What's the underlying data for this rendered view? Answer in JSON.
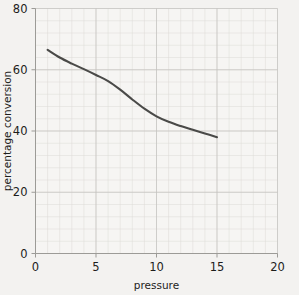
{
  "chart_data": {
    "type": "line",
    "title": "",
    "xlabel": "pressure",
    "ylabel": "percentage conversion",
    "xlim": [
      0,
      20
    ],
    "ylim": [
      0,
      80
    ],
    "xticks": [
      0,
      5,
      10,
      15,
      20
    ],
    "yticks": [
      0,
      20,
      40,
      60,
      80
    ],
    "xtick_labels": [
      "0",
      "5",
      "10",
      "15",
      "20"
    ],
    "ytick_labels": [
      "0",
      "20",
      "40",
      "60",
      "80"
    ],
    "grid": true,
    "grid_minor_step": 1,
    "grid_major_step": 5,
    "legend": null,
    "series": [
      {
        "name": "percentage conversion vs pressure",
        "color": "#4a4a48",
        "x": [
          1.0,
          2.0,
          3.0,
          4.0,
          5.0,
          6.0,
          7.0,
          8.0,
          9.0,
          10.0,
          11.0,
          12.0,
          13.0,
          14.0,
          15.0
        ],
        "values": [
          66.5,
          64.0,
          62.0,
          60.2,
          58.3,
          56.3,
          53.5,
          50.3,
          47.3,
          44.8,
          43.0,
          41.6,
          40.4,
          39.2,
          38.0
        ]
      }
    ]
  },
  "colors": {
    "background": "#f3f2f0",
    "plot_background": "#f6f5f3",
    "grid_minor": "#dcdbd7",
    "grid_major": "#c3c2be",
    "axis": "#9c9b97",
    "curve": "#4a4a48",
    "text": "#1d1d1b"
  }
}
